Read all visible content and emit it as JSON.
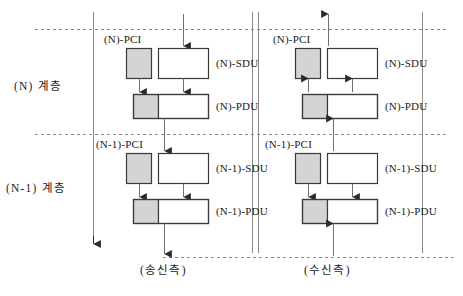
{
  "diagram": {
    "title_present": false,
    "layers": [
      {
        "id": "layer-n",
        "label": "(N) 계층"
      },
      {
        "id": "layer-n-1",
        "label": "(N-1) 계층"
      }
    ],
    "sides": [
      {
        "id": "send",
        "label": "(송신측)",
        "direction": "down"
      },
      {
        "id": "receive",
        "label": "(수신측)",
        "direction": "up"
      }
    ],
    "blocks": {
      "n_pci": "(N)-PCI",
      "n_sdu": "(N)-SDU",
      "n_pdu": "(N)-PDU",
      "n1_pci": "(N-1)-PCI",
      "n1_sdu": "(N-1)-SDU",
      "n1_pdu": "(N-1)-PDU"
    },
    "colors": {
      "line": "#6f6f6f",
      "box_border": "#3a3a3a",
      "pci_fill": "#d4d4d4",
      "sdu_fill": "#ffffff",
      "text": "#1a1a1a",
      "dashed": "#8a8a8a"
    },
    "annotations": {
      "left_flow_arrow": "downward vertical arrow spanning both layers",
      "center_divider": "double vertical rule separating send and receive halves"
    }
  }
}
